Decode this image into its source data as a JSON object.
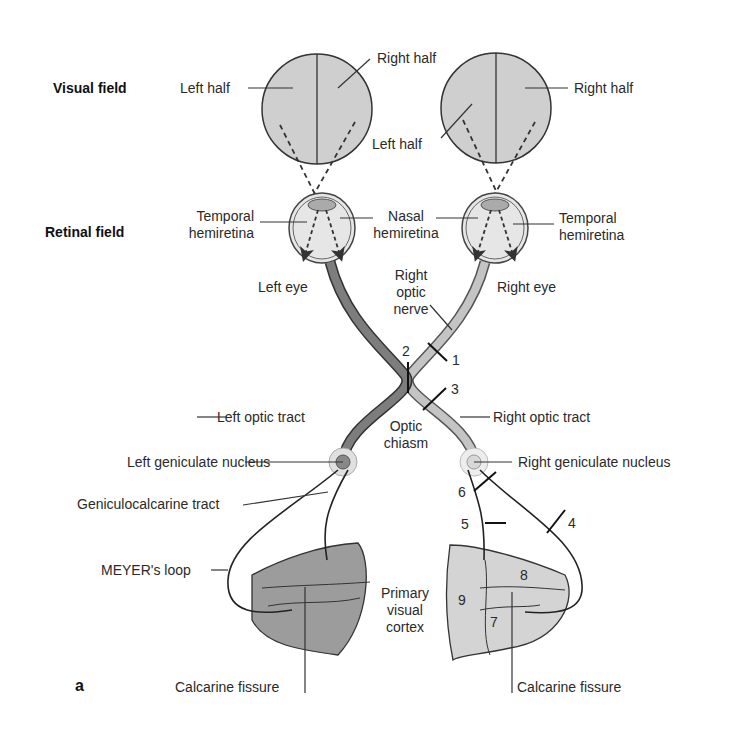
{
  "figure": {
    "panel_letter": "a",
    "row_labels": {
      "visual_field": "Visual field",
      "retinal_field": "Retinal field"
    },
    "labels": {
      "left_eye_left_half": "Left half",
      "left_eye_right_half": "Right half",
      "right_eye_left_half": "Left half",
      "right_eye_right_half": "Right half",
      "left_temporal_hemiretina": [
        "Temporal",
        "hemiretina"
      ],
      "nasal_hemiretina": [
        "Nasal",
        "hemiretina"
      ],
      "right_temporal_hemiretina": [
        "Temporal",
        "hemiretina"
      ],
      "left_eye": "Left eye",
      "right_eye": "Right eye",
      "right_optic_nerve": [
        "Right",
        "optic",
        "nerve"
      ],
      "left_optic_tract": "Left optic tract",
      "right_optic_tract": "Right optic tract",
      "optic_chiasm": [
        "Optic",
        "chiasm"
      ],
      "left_geniculate_nucleus": "Left geniculate nucleus",
      "right_geniculate_nucleus": "Right geniculate nucleus",
      "geniculocalcarine_tract": "Geniculocalcarine tract",
      "meyers_loop": "MEYER's loop",
      "primary_visual_cortex": [
        "Primary",
        "visual",
        "cortex"
      ],
      "left_calcarine_fissure": "Calcarine fissure",
      "right_calcarine_fissure": "Calcarine fissure"
    },
    "lesion_numbers": [
      "1",
      "2",
      "3",
      "4",
      "5",
      "6",
      "7",
      "8",
      "9"
    ],
    "colors": {
      "field_fill": "#cfcfcf",
      "left_pathway": "#7a7a7a",
      "right_pathway": "#bdbdbd",
      "left_cortex": "#9a9a9a",
      "right_cortex": "#d4d4d4",
      "line": "#222222"
    }
  }
}
